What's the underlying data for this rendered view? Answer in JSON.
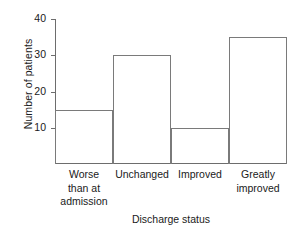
{
  "chart_data": {
    "type": "bar",
    "title": "",
    "subtitle": "",
    "categories": [
      "Worse than at admission",
      "Unchanged",
      "Improved",
      "Greatly improved"
    ],
    "category_lines": [
      [
        "Worse",
        "than at",
        "admission"
      ],
      [
        "Unchanged"
      ],
      [
        "Improved"
      ],
      [
        "Greatly",
        "improved"
      ]
    ],
    "values": [
      15,
      30,
      10,
      35
    ],
    "xlabel": "Discharge status",
    "ylabel": "Number of patients",
    "ylim": [
      0,
      40
    ],
    "yticks": [
      10,
      20,
      30,
      40
    ],
    "ytick_labels": [
      "10",
      "20",
      "30",
      "40"
    ],
    "grid": false,
    "legend": false,
    "legend_position": "none",
    "bar_gap": 0,
    "colors": {
      "bar_stroke": "#7a7a7a",
      "bar_fill": "none",
      "axis": "#6d6d6d",
      "text": "#1a1a1a",
      "background": "#ffffff"
    }
  }
}
